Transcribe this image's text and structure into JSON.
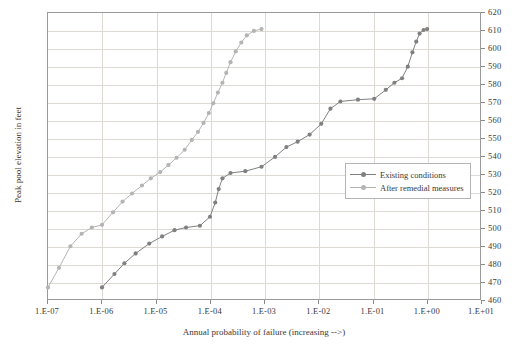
{
  "chart_data": {
    "type": "line",
    "title": "",
    "xlabel": "Annual probability of failure (increasing -->)",
    "ylabel": "Peak pool elevation in feet",
    "x_scale": "log",
    "xlim": [
      1e-07,
      10.0
    ],
    "ylim": [
      460,
      620
    ],
    "xticks": [
      "1.E-07",
      "1.E-06",
      "1.E-05",
      "1.E-04",
      "1.E-03",
      "1.E-02",
      "1.E-01",
      "1.E+00",
      "1.E+01"
    ],
    "xtick_values": [
      1e-07,
      1e-06,
      1e-05,
      0.0001,
      0.001,
      0.01,
      0.1,
      1,
      10
    ],
    "yticks": [
      "460",
      "470",
      "480",
      "490",
      "500",
      "510",
      "520",
      "530",
      "540",
      "550",
      "560",
      "570",
      "580",
      "590",
      "600",
      "610",
      "620"
    ],
    "ytick_values": [
      460,
      470,
      480,
      490,
      500,
      510,
      520,
      530,
      540,
      550,
      560,
      570,
      580,
      590,
      600,
      610,
      620
    ],
    "grid": true,
    "legend_position": "right-center",
    "series": [
      {
        "name": "Existing conditions",
        "color": "#808080",
        "marker": "circle",
        "points": [
          [
            1e-06,
            466.5
          ],
          [
            1.7e-06,
            474.0
          ],
          [
            2.6e-06,
            480.0
          ],
          [
            4.2e-06,
            485.5
          ],
          [
            7.5e-06,
            491.0
          ],
          [
            1.3e-05,
            495.0
          ],
          [
            2.2e-05,
            498.5
          ],
          [
            3.6e-05,
            500.0
          ],
          [
            6.5e-05,
            501.0
          ],
          [
            0.0001,
            506.0
          ],
          [
            0.000125,
            514.0
          ],
          [
            0.000145,
            521.5
          ],
          [
            0.00017,
            527.5
          ],
          [
            0.00024,
            530.5
          ],
          [
            0.00045,
            531.5
          ],
          [
            0.0009,
            534.0
          ],
          [
            0.0016,
            539.5
          ],
          [
            0.0026,
            545.0
          ],
          [
            0.0042,
            548.0
          ],
          [
            0.007,
            552.0
          ],
          [
            0.0115,
            558.0
          ],
          [
            0.017,
            566.5
          ],
          [
            0.026,
            570.5
          ],
          [
            0.055,
            571.5
          ],
          [
            0.11,
            572.0
          ],
          [
            0.18,
            577.0
          ],
          [
            0.26,
            581.0
          ],
          [
            0.36,
            583.5
          ],
          [
            0.46,
            590.0
          ],
          [
            0.56,
            598.0
          ],
          [
            0.66,
            604.0
          ],
          [
            0.76,
            608.5
          ],
          [
            0.9,
            610.5
          ],
          [
            1.05,
            611.0
          ]
        ]
      },
      {
        "name": "After remedial measures",
        "color": "#b4b4b4",
        "marker": "circle",
        "points": [
          [
            1e-07,
            466.5
          ],
          [
            1.6e-07,
            477.5
          ],
          [
            2.6e-07,
            489.5
          ],
          [
            4.2e-07,
            496.5
          ],
          [
            6.5e-07,
            500.0
          ],
          [
            1e-06,
            501.5
          ],
          [
            1.6e-06,
            508.5
          ],
          [
            2.4e-06,
            514.5
          ],
          [
            3.6e-06,
            519.0
          ],
          [
            5.5e-06,
            523.5
          ],
          [
            8e-06,
            527.5
          ],
          [
            1.2e-05,
            531.0
          ],
          [
            1.7e-05,
            535.0
          ],
          [
            2.4e-05,
            539.0
          ],
          [
            3.4e-05,
            543.5
          ],
          [
            4.6e-05,
            549.0
          ],
          [
            6e-05,
            553.5
          ],
          [
            7.6e-05,
            558.5
          ],
          [
            9.5e-05,
            564.0
          ],
          [
            0.000115,
            569.5
          ],
          [
            0.00014,
            575.5
          ],
          [
            0.00017,
            581.0
          ],
          [
            0.0002,
            586.5
          ],
          [
            0.00024,
            592.5
          ],
          [
            0.0003,
            598.5
          ],
          [
            0.00038,
            603.5
          ],
          [
            0.00048,
            607.5
          ],
          [
            0.00065,
            610.0
          ],
          [
            0.0009,
            611.0
          ]
        ]
      }
    ]
  },
  "legend": {
    "entries": [
      {
        "label": "Existing conditions"
      },
      {
        "label": "After remedial measures"
      }
    ]
  }
}
